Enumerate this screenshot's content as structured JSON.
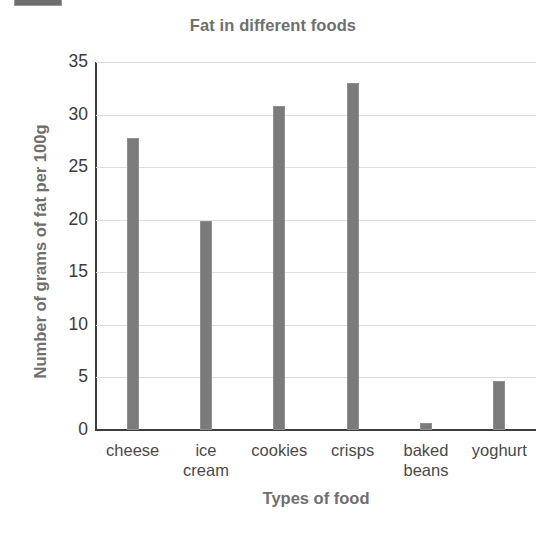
{
  "decoration": {
    "corner_mark": "cropped-gray-tab"
  },
  "chart_data": {
    "type": "bar",
    "title": "Fat in different foods",
    "xlabel": "Types of food",
    "ylabel": "Number of grams of fat per 100g",
    "categories": [
      "cheese",
      "ice cream",
      "cookies",
      "crisps",
      "baked beans",
      "yoghurt"
    ],
    "category_lines": [
      [
        "cheese"
      ],
      [
        "ice",
        "cream"
      ],
      [
        "cookies"
      ],
      [
        "crisps"
      ],
      [
        "baked",
        "beans"
      ],
      [
        "yoghurt"
      ]
    ],
    "values": [
      27.8,
      19.9,
      30.8,
      33.0,
      0.7,
      4.7
    ],
    "ylim": [
      0,
      35
    ],
    "yticks": [
      0,
      5,
      10,
      15,
      20,
      25,
      30,
      35
    ],
    "ytick_labels": [
      "0",
      "5",
      "10",
      "15",
      "20",
      "25",
      "30",
      "35"
    ],
    "grid": true,
    "legend": false,
    "bar_color": "#7b7b7b",
    "grid_color": "#dedede",
    "axis_color": "#3d3d3d",
    "title_color": "#6f6f6f"
  }
}
